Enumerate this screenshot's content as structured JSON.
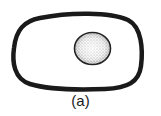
{
  "figure": {
    "caption": "(a)",
    "cell": {
      "shape": "rounded-rectangle",
      "stroke_color": "#1a1a1a",
      "fill_color": "#ffffff"
    },
    "nucleus": {
      "shape": "circle",
      "texture": "stippled",
      "stroke_color": "#1a1a1a",
      "fill_color": "#e6e6e6"
    }
  }
}
